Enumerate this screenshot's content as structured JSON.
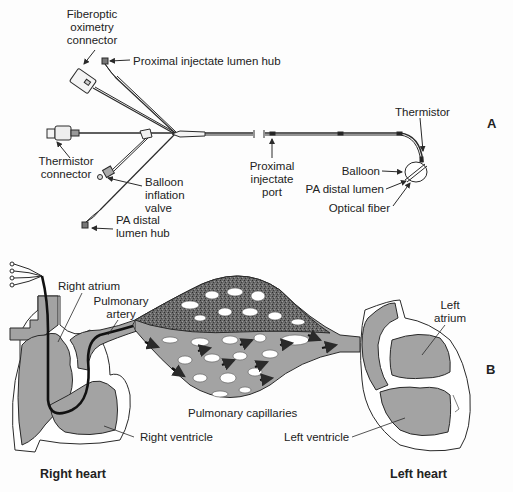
{
  "panel_a": {
    "panel_label": "A",
    "labels": {
      "fiberoptic_connector": [
        "Fiberoptic",
        "oximetry",
        "connector"
      ],
      "proximal_hub": "Proximal injectate lumen hub",
      "thermistor_connector": [
        "Thermistor",
        "connector"
      ],
      "balloon_valve": [
        "Balloon",
        "inflation",
        "valve"
      ],
      "pa_distal_hub": [
        "PA distal",
        "lumen hub"
      ],
      "proximal_port": [
        "Proximal",
        "injectate",
        "port"
      ],
      "thermistor": "Thermistor",
      "balloon": "Balloon",
      "pa_distal_lumen": "PA distal lumen",
      "optical_fiber": "Optical fiber"
    }
  },
  "panel_b": {
    "panel_label": "B",
    "labels": {
      "right_atrium": "Right atrium",
      "pulmonary_artery": [
        "Pulmonary",
        "artery"
      ],
      "pulmonary_capillaries": "Pulmonary capillaries",
      "right_ventricle": "Right ventricle",
      "left_ventricle": "Left ventricle",
      "left_atrium": [
        "Left",
        "atrium"
      ],
      "right_heart": "Right heart",
      "left_heart": "Left heart"
    }
  },
  "colors": {
    "line": "#2a2a2a",
    "tissue_gray": "#a3a3a3",
    "speckle_dark": "#555555",
    "background": "#fdfdfd"
  }
}
